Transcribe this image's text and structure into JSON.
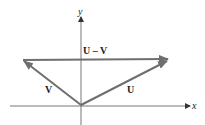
{
  "diagram": {
    "title": "",
    "axes": {
      "x_label": "x",
      "y_label": "y"
    },
    "vectors": [
      {
        "name": "U",
        "label": "U",
        "from": [
          0,
          0
        ],
        "to": [
          1,
          1
        ]
      },
      {
        "name": "V",
        "label": "V",
        "from": [
          0,
          0
        ],
        "to": [
          -1,
          1
        ]
      },
      {
        "name": "U-V",
        "label": "U – V",
        "from": "tip of V",
        "to": "tip of U"
      }
    ],
    "colors": {
      "vector": "#6e6e6e",
      "axis": "#555555",
      "text": "#222222"
    }
  }
}
